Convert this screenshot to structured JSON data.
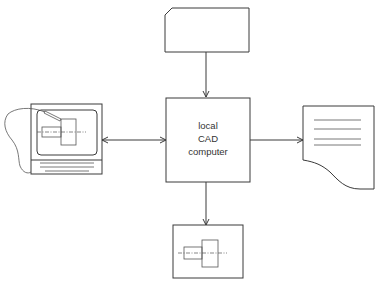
{
  "diagram": {
    "type": "block-diagram",
    "central_node": {
      "lines": [
        "local",
        "CAD",
        "computer"
      ]
    },
    "nodes": [
      {
        "id": "input-card",
        "shape": "punched-card",
        "position": "top"
      },
      {
        "id": "graphics-terminal",
        "shape": "display-terminal-with-light-pen",
        "position": "left"
      },
      {
        "id": "printout",
        "shape": "document",
        "position": "right"
      },
      {
        "id": "plotter-output",
        "shape": "drawing-sheet",
        "position": "bottom"
      }
    ],
    "edges": [
      {
        "from": "input-card",
        "to": "central",
        "direction": "one-way"
      },
      {
        "from": "graphics-terminal",
        "to": "central",
        "direction": "two-way"
      },
      {
        "from": "central",
        "to": "printout",
        "direction": "one-way"
      },
      {
        "from": "central",
        "to": "plotter-output",
        "direction": "one-way"
      }
    ]
  },
  "colors": {
    "line": "#3a3a3a",
    "background": "#ffffff"
  }
}
